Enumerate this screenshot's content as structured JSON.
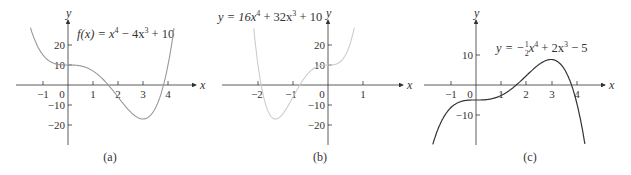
{
  "chart_data": [
    {
      "type": "line",
      "panel": "(a)",
      "title": "f(x) = x^4 - 4x^3 + 10",
      "formula": {
        "lhs": "f(x) = x",
        "e1": "4",
        "mid": " − 4x",
        "e2": "3",
        "rhs": " + 10"
      },
      "xlabel": "x",
      "ylabel": "y",
      "xticks": [
        -1,
        0,
        1,
        2,
        3,
        4
      ],
      "yticks": [
        20,
        10,
        -10,
        -20
      ],
      "xlim": [
        -1.6,
        4.4
      ],
      "ylim": [
        -30,
        30
      ],
      "coefficients": {
        "a4": 1,
        "a3": -4,
        "a2": 0,
        "a1": 0,
        "a0": 10
      },
      "points": [
        [
          -1.5,
          28.6
        ],
        [
          -1,
          15
        ],
        [
          0,
          10
        ],
        [
          1,
          7
        ],
        [
          2,
          -6
        ],
        [
          3,
          -17
        ],
        [
          3.5,
          -11.4
        ],
        [
          4,
          10
        ]
      ],
      "color": "#999999",
      "caption": "(a)"
    },
    {
      "type": "line",
      "panel": "(b)",
      "title": "y = 16x^4 + 32x^3 + 10",
      "formula": {
        "lhs": "y = 16x",
        "e1": "4",
        "mid": " + 32x",
        "e2": "3",
        "rhs": " + 10"
      },
      "xlabel": "x",
      "ylabel": "y",
      "xticks": [
        -2,
        -1,
        0,
        1
      ],
      "yticks": [
        20,
        10,
        -10,
        -20
      ],
      "xlim": [
        -2.9,
        1.9
      ],
      "ylim": [
        -30,
        30
      ],
      "coefficients": {
        "a4": 1,
        "a3": 2,
        "a2": 0,
        "a1": 0,
        "a0": 10
      },
      "points": [
        [
          -2.2,
          14.7
        ],
        [
          -2,
          10
        ],
        [
          -1.5,
          8.3
        ],
        [
          -1,
          9
        ],
        [
          0,
          10
        ],
        [
          0.75,
          11.2
        ]
      ],
      "color": "#cccccc",
      "caption": "(b)"
    },
    {
      "type": "line",
      "panel": "(c)",
      "title": "y = -1/2 x^4 + 2x^3 - 5",
      "formula": {
        "lhs": "y = −",
        "frac_num": "1",
        "frac_den": "2",
        "x1": "x",
        "e1": "4",
        "mid": " + 2x",
        "e2": "3",
        "rhs": " − 5"
      },
      "xlabel": "x",
      "ylabel": "y",
      "xticks": [
        -1,
        0,
        1,
        2,
        3,
        4
      ],
      "yticks": [
        10,
        -10
      ],
      "xlim": [
        -1.7,
        4.7
      ],
      "ylim": [
        -20,
        20
      ],
      "coefficients": {
        "a4": -0.5,
        "a3": 2,
        "a2": 0,
        "a1": 0,
        "a0": -5
      },
      "points": [
        [
          -1.7,
          -20
        ],
        [
          -1,
          -7.5
        ],
        [
          0,
          -5
        ],
        [
          1,
          -3.5
        ],
        [
          2,
          3
        ],
        [
          3,
          8.5
        ],
        [
          4,
          -5
        ],
        [
          4.4,
          -20
        ]
      ],
      "color": "#333333",
      "caption": "(c)"
    }
  ],
  "labels": {
    "a": {
      "caption": "(a)",
      "x": "x",
      "y": "y",
      "xt": [
        "−1",
        "0",
        "1",
        "2",
        "3",
        "4"
      ],
      "yt": [
        "20",
        "10",
        "−10",
        "−20"
      ]
    },
    "b": {
      "caption": "(b)",
      "x": "x",
      "y": "y",
      "xt": [
        "−2",
        "−1",
        "0",
        "1"
      ],
      "yt": [
        "20",
        "10",
        "−10",
        "−20"
      ]
    },
    "c": {
      "caption": "(c)",
      "x": "x",
      "y": "y",
      "xt": [
        "−1",
        "0",
        "1",
        "2",
        "3",
        "4"
      ],
      "yt": [
        "10",
        "−10"
      ]
    }
  }
}
